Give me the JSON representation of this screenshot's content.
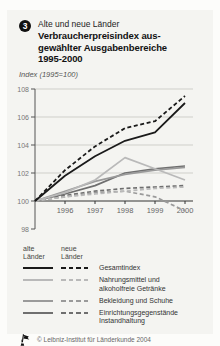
{
  "figure": {
    "number": "3",
    "region_label": "Alte und neue Länder",
    "title_lines": [
      "Verbraucherpreisindex aus-",
      "gewählter Ausgabenbereiche",
      "1995-2000"
    ],
    "index_note": "Index (1995=100)"
  },
  "chart_data": {
    "type": "line",
    "ylabel": "Index (1995=100)",
    "ylim": [
      98,
      108
    ],
    "grid": "horizontal",
    "x": [
      1995,
      1996,
      1997,
      1998,
      1999,
      2000
    ],
    "y_ticks": [
      98,
      100,
      102,
      104,
      106,
      108
    ],
    "series": [
      {
        "id": "einrichtung-alte",
        "name": "Einrichtungsgegenstände Instandhaltung (alte Länder)",
        "color": "#6f6f6f",
        "dash": false,
        "values": [
          100,
          100.5,
          101.1,
          102.0,
          102.3,
          102.5
        ]
      },
      {
        "id": "einrichtung-neue",
        "name": "Einrichtungsgegenstände Instandhaltung (neue Länder)",
        "color": "#6f6f6f",
        "dash": true,
        "values": [
          100,
          100.4,
          100.7,
          100.9,
          101.0,
          101.1
        ]
      },
      {
        "id": "bekleidung-alte",
        "name": "Bekleidung und Schuhe (alte Länder)",
        "color": "#9a9a9a",
        "dash": false,
        "values": [
          100,
          100.7,
          101.4,
          101.9,
          102.2,
          102.4
        ]
      },
      {
        "id": "bekleidung-neue",
        "name": "Bekleidung und Schuhe (neue Länder)",
        "color": "#9a9a9a",
        "dash": true,
        "values": [
          100,
          100.3,
          100.6,
          100.7,
          100.3,
          99.3
        ]
      },
      {
        "id": "nahrungsmittel-neue",
        "name": "Nahrungsmittel und alkoholfreie Getränke (neue Länder)",
        "color": "#b9b9b9",
        "dash": true,
        "values": [
          100,
          100.3,
          100.5,
          100.7,
          100.9,
          101.0
        ]
      },
      {
        "id": "nahrungsmittel-alte",
        "name": "Nahrungsmittel und alkoholfreie Getränke (alte Länder)",
        "color": "#b9b9b9",
        "dash": false,
        "values": [
          100,
          100.6,
          101.5,
          103.1,
          102.3,
          101.5
        ]
      },
      {
        "id": "gesamtindex-alte",
        "name": "Gesamtindex (alte Länder)",
        "color": "#1a1a1a",
        "dash": false,
        "values": [
          100,
          101.8,
          103.2,
          104.3,
          104.9,
          107.0
        ]
      },
      {
        "id": "gesamtindex-neue",
        "name": "Gesamtindex (neue Länder)",
        "color": "#1a1a1a",
        "dash": true,
        "values": [
          100,
          102.2,
          103.9,
          105.2,
          105.7,
          107.5
        ]
      }
    ]
  },
  "legend": {
    "col_headers": [
      "alte\nLänder",
      "neue\nLänder"
    ],
    "rows": [
      {
        "label": "Gesamtindex",
        "color": "#1a1a1a"
      },
      {
        "label": "Nahrungsmittel und alkoholfreie Getränke",
        "color": "#b9b9b9"
      },
      {
        "label": "Bekleidung und Schuhe",
        "color": "#9a9a9a"
      },
      {
        "label": "Einrichtungsgegenstände Instandhaltung",
        "color": "#6f6f6f"
      }
    ]
  },
  "footer": {
    "copyright": "© Leibniz-Institut für Länderkunde 2004"
  }
}
